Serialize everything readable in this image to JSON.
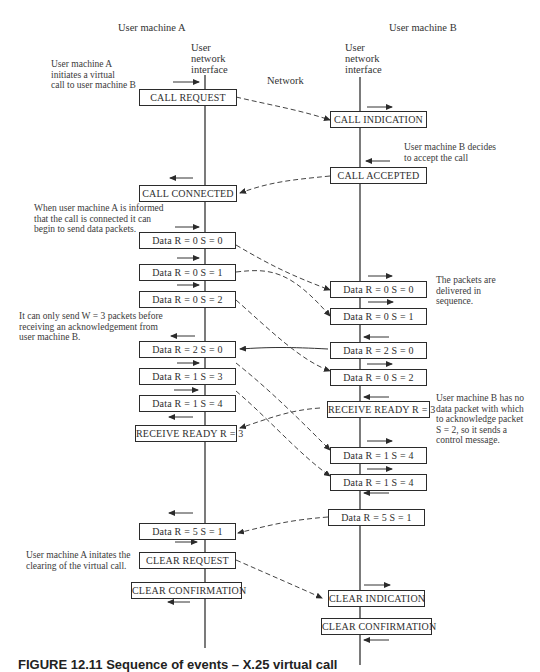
{
  "header": {
    "machine_a": "User machine A",
    "machine_b": "User machine B",
    "interface_a": [
      "User",
      "network",
      "interface"
    ],
    "interface_b": [
      "User",
      "network",
      "interface"
    ],
    "network": "Network"
  },
  "notes": {
    "a_initiates": "User machine A\ninitiates a virtual\ncall to user machine B",
    "b_decides": "User machine B decides\nto accept the call",
    "a_informed": "When user machine A is informed\nthat the call is connected it can\nbegin to send data packets.",
    "in_sequence": "The packets are\ndelivered in\nsequence.",
    "window": "It can only send W = 3 packets before\nreceiving an acknowledgement from\nuser machine B.",
    "b_no_data": "User machine B has no\ndata packet with which\nto acknowledge packet\nS = 2, so it sends a\ncontrol message.",
    "a_clears": "User machine A initates the\nclearing of the virtual call."
  },
  "side_a": [
    {
      "text": "CALL REQUEST"
    },
    {
      "text": "CALL CONNECTED"
    },
    {
      "text": "Data R = 0  S = 0"
    },
    {
      "text": "Data R = 0  S = 1"
    },
    {
      "text": "Data R = 0  S = 2"
    },
    {
      "text": "Data R = 2  S = 0"
    },
    {
      "text": "Data R = 1  S = 3"
    },
    {
      "text": "Data R = 1  S = 4"
    },
    {
      "text": "RECEIVE READY R = 3"
    },
    {
      "text": "Data R = 5  S = 1"
    },
    {
      "text": "CLEAR REQUEST"
    },
    {
      "text": "CLEAR CONFIRMATION"
    }
  ],
  "side_b": [
    {
      "text": "CALL INDICATION"
    },
    {
      "text": "CALL ACCEPTED"
    },
    {
      "text": "Data R = 0  S = 0"
    },
    {
      "text": "Data R = 0  S = 1"
    },
    {
      "text": "Data R = 2  S = 0"
    },
    {
      "text": "Data R = 0  S = 2"
    },
    {
      "text": "RECEIVE READY R = 3"
    },
    {
      "text": "Data R = 1  S = 4"
    },
    {
      "text": "Data R = 1  S = 4"
    },
    {
      "text": "Data R = 5  S = 1"
    },
    {
      "text": "CLEAR INDICATION"
    },
    {
      "text": "CLEAR CONFIRMATION"
    }
  ],
  "caption": "FIGURE 12.11   Sequence of events – X.25 virtual call"
}
